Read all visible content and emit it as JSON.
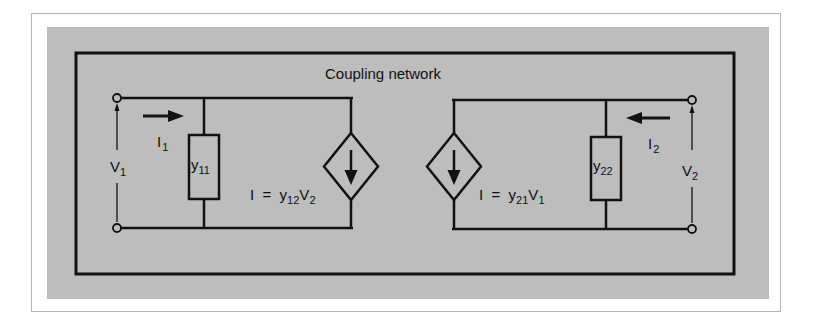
{
  "diagram": {
    "title": "Coupling network",
    "colors": {
      "background": "#ffffff",
      "frame_border": "#b5b5b5",
      "panel": "#bdbdbd",
      "stroke": "#111111"
    },
    "port1": {
      "current": {
        "main": "I",
        "sub": "1"
      },
      "voltage": {
        "main": "V",
        "sub": "1"
      },
      "admittance": {
        "main": "y",
        "sub": "11"
      },
      "source_eq": {
        "prefix": "I  =  ",
        "y": "y",
        "ysub": "12",
        "v": "V",
        "vsub": "2"
      }
    },
    "port2": {
      "current": {
        "main": "I",
        "sub": "2"
      },
      "voltage": {
        "main": "V",
        "sub": "2"
      },
      "admittance": {
        "main": "y",
        "sub": "22"
      },
      "source_eq": {
        "prefix": "I  =  ",
        "y": "y",
        "ysub": "21",
        "v": "V",
        "vsub": "1"
      }
    }
  }
}
